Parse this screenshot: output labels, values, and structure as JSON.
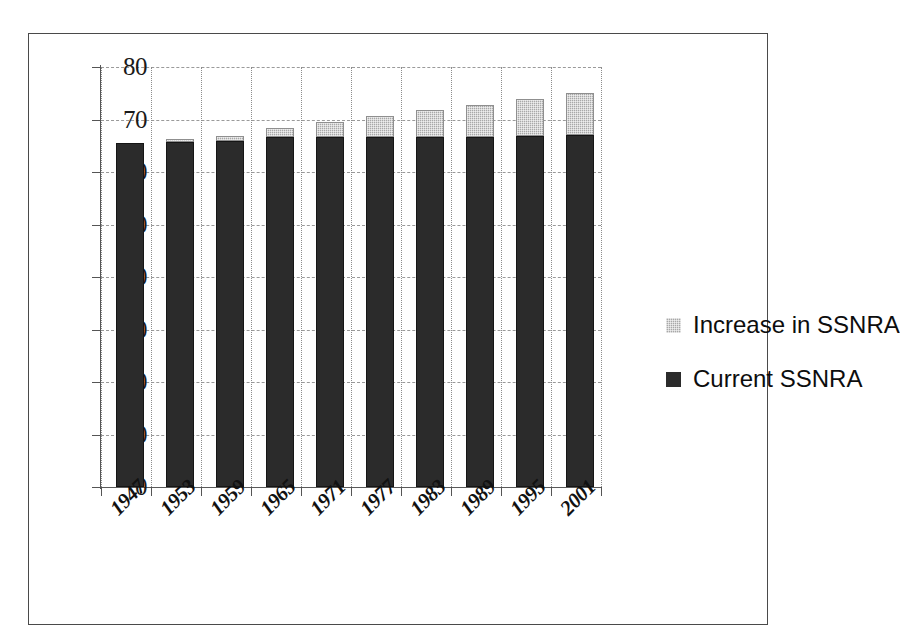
{
  "chart_data": {
    "type": "bar",
    "title": "",
    "subtitle": "",
    "xlabel": "",
    "ylabel": "",
    "stacked": true,
    "grid": true,
    "legend_position": "right",
    "ylim": [
      0,
      80
    ],
    "ytick_step": 10,
    "ytick_labels": [
      "80",
      "70",
      "60",
      "50",
      "40",
      "30",
      "20",
      "10",
      "0"
    ],
    "ytick_values": [
      80,
      70,
      60,
      50,
      40,
      30,
      20,
      10,
      0
    ],
    "categories": [
      "1947",
      "1953",
      "1959",
      "1965",
      "1971",
      "1977",
      "1983",
      "1989",
      "1995",
      "2001"
    ],
    "series": [
      {
        "name": "Current SSNRA",
        "color": "#2b2b2b",
        "values": [
          65.6,
          65.8,
          66.0,
          66.7,
          66.7,
          66.7,
          66.7,
          66.7,
          66.9,
          67.0
        ]
      },
      {
        "name": "Increase in SSNRA",
        "color": "#a8a8a8",
        "values": [
          0.0,
          0.4,
          0.9,
          1.7,
          2.8,
          3.9,
          5.1,
          6.1,
          7.0,
          8.0
        ]
      }
    ],
    "totals": [
      65.6,
      66.2,
      66.9,
      68.4,
      69.5,
      70.6,
      71.8,
      72.8,
      73.9,
      75.0
    ]
  },
  "legend": {
    "entries": [
      {
        "label": "Increase in SSNRA",
        "swatch": "increase"
      },
      {
        "label": "Current SSNRA",
        "swatch": "current"
      }
    ]
  }
}
